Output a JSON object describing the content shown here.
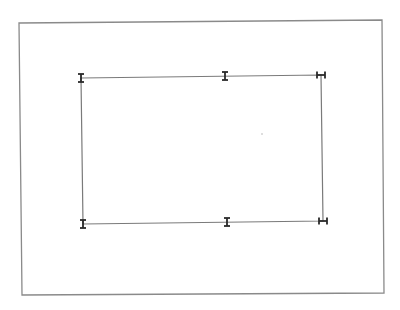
{
  "canvas": {
    "width": 400,
    "height": 310,
    "background": "#ffffff"
  },
  "frame": {
    "points": "19,23 382,20 384,293 22,295",
    "stroke": "#8a8a8a"
  },
  "rectangle": {
    "points": "81,78 321,75 323,221 83,224",
    "stroke": "#7a7a7a"
  },
  "handles": [
    {
      "name": "handle-top-left",
      "type": "I",
      "x": 81,
      "y": 78
    },
    {
      "name": "handle-top-middle",
      "type": "I",
      "x": 225,
      "y": 76
    },
    {
      "name": "handle-top-right",
      "type": "H",
      "x": 321,
      "y": 75
    },
    {
      "name": "handle-bottom-left",
      "type": "I",
      "x": 83,
      "y": 224
    },
    {
      "name": "handle-bottom-middle",
      "type": "I",
      "x": 227,
      "y": 222
    },
    {
      "name": "handle-bottom-right",
      "type": "H",
      "x": 323,
      "y": 221
    }
  ],
  "handle_color": "#2a2a2a",
  "speck": {
    "x": 262,
    "y": 134
  }
}
